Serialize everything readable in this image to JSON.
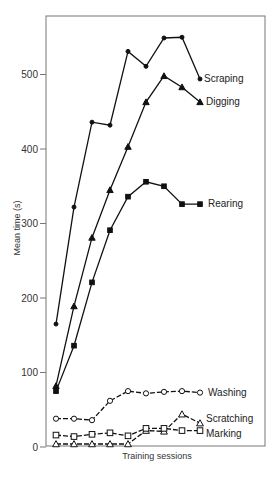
{
  "chart_data": {
    "type": "line",
    "title": "",
    "xlabel": "Training sessions",
    "ylabel": "Mean time (s)",
    "ylim": [
      0,
      560
    ],
    "yticks": [
      0,
      100,
      200,
      300,
      400,
      500
    ],
    "grid": false,
    "legend_position": "inline labels at right end of each line",
    "x": [
      1,
      2,
      3,
      4,
      5,
      6,
      7,
      8,
      9
    ],
    "series": [
      {
        "name": "Scraping",
        "marker": "filled-circle",
        "line": "solid",
        "values": [
          165,
          322,
          436,
          432,
          531,
          511,
          549,
          550,
          494
        ]
      },
      {
        "name": "Digging",
        "marker": "filled-triangle",
        "line": "solid",
        "values": [
          82,
          189,
          281,
          345,
          403,
          463,
          498,
          483,
          463
        ]
      },
      {
        "name": "Rearing",
        "marker": "filled-square",
        "line": "solid",
        "values": [
          75,
          136,
          221,
          291,
          336,
          356,
          350,
          326,
          326
        ]
      },
      {
        "name": "Washing",
        "marker": "open-circle",
        "line": "dashed",
        "values": [
          38,
          38,
          36,
          62,
          75,
          72,
          74,
          75,
          73
        ]
      },
      {
        "name": "Scratching",
        "marker": "open-triangle",
        "line": "dashed",
        "values": [
          4,
          4,
          4,
          4,
          4,
          22,
          21,
          44,
          32
        ]
      },
      {
        "name": "Marking",
        "marker": "open-square",
        "line": "dashed",
        "values": [
          16,
          14,
          17,
          19,
          15,
          25,
          25,
          22,
          22
        ]
      }
    ]
  },
  "layout": {
    "frame": {
      "left": 46,
      "top": 16,
      "right": 265,
      "bottom": 446
    },
    "y_zero_px": 447,
    "px_per_unit": 0.745,
    "x_first_px": 56,
    "x_step_px": 18,
    "label_offsets": {
      "Scraping": [
        4,
        3
      ],
      "Digging": [
        6,
        3
      ],
      "Rearing": [
        8,
        3
      ],
      "Washing": [
        8,
        3
      ],
      "Scratching": [
        6,
        -1
      ],
      "Marking": [
        6,
        6
      ]
    },
    "colors": {
      "line": "#111111",
      "frame": "#777777",
      "text": "#333333"
    }
  }
}
